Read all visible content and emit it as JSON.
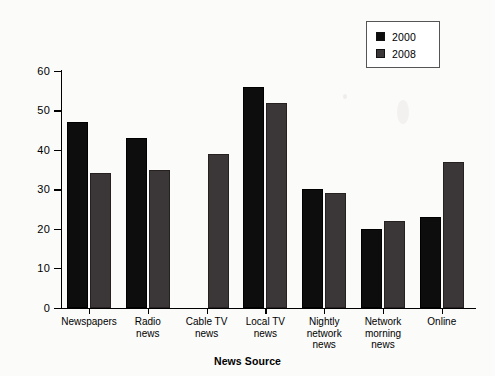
{
  "chart_data": {
    "type": "bar",
    "title": "",
    "xlabel": "News Source",
    "ylabel": "Percentage of People",
    "categories": [
      "Newspapers",
      "Radio news",
      "Cable TV news",
      "Local TV news",
      "Nightly network news",
      "Network morning news",
      "Online"
    ],
    "category_lines": [
      [
        "Newspapers"
      ],
      [
        "Radio",
        "news"
      ],
      [
        "Cable TV",
        "news"
      ],
      [
        "Local TV",
        "news"
      ],
      [
        "Nightly",
        "network",
        "news"
      ],
      [
        "Network",
        "morning",
        "news"
      ],
      [
        "Online"
      ]
    ],
    "series": [
      {
        "name": "2000",
        "color": "#0d0d0d",
        "values": [
          47,
          43,
          null,
          56,
          30,
          20,
          23
        ]
      },
      {
        "name": "2008",
        "color": "#3b3637",
        "values": [
          34,
          35,
          39,
          52,
          29,
          22,
          37
        ]
      }
    ],
    "ylim": [
      0,
      60
    ],
    "yticks": [
      0,
      10,
      20,
      30,
      40,
      50,
      60
    ],
    "grid": false,
    "legend_position": "top-right"
  },
  "legend": {
    "entries": [
      {
        "label": "2000",
        "color": "#0d0d0d"
      },
      {
        "label": "2008",
        "color": "#3b3637"
      }
    ]
  }
}
